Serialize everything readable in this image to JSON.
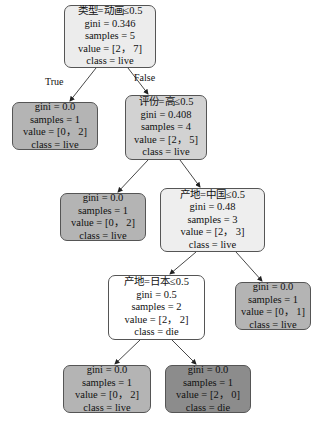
{
  "tree": {
    "nodes": [
      {
        "id": "root",
        "split": "类型=动画≤0.5",
        "gini": "gini = 0.346",
        "samples": "samples = 5",
        "value": "value = [2， 7]",
        "class": "class = live",
        "fill": "#ececec"
      },
      {
        "id": "n1",
        "gini": "gini = 0.0",
        "samples": "samples = 1",
        "value": "value = [0， 2]",
        "class": "class = live",
        "fill": "#b4b4b4"
      },
      {
        "id": "n2",
        "split": "评份=高≤0.5",
        "gini": "gini = 0.408",
        "samples": "samples = 4",
        "value": "value = [2， 5]",
        "class": "class = live",
        "fill": "#d2d2d2"
      },
      {
        "id": "n3",
        "gini": "gini = 0.0",
        "samples": "samples = 1",
        "value": "value = [0， 2]",
        "class": "class = live",
        "fill": "#b4b4b4"
      },
      {
        "id": "n4",
        "split": "产地=中国≤0.5",
        "gini": "gini = 0.48",
        "samples": "samples = 3",
        "value": "value = [2， 3]",
        "class": "class = live",
        "fill": "#eeeeee"
      },
      {
        "id": "n5",
        "split": "产地=日本≤0.5",
        "gini": "gini = 0.5",
        "samples": "samples = 2",
        "value": "value = [2， 2]",
        "class": "class = die",
        "fill": "#ffffff"
      },
      {
        "id": "n6",
        "gini": "gini = 0.0",
        "samples": "samples = 1",
        "value": "value = [0， 1]",
        "class": "class = live",
        "fill": "#b4b4b4"
      },
      {
        "id": "n7",
        "gini": "gini = 0.0",
        "samples": "samples = 1",
        "value": "value = [0， 2]",
        "class": "class = live",
        "fill": "#b4b4b4"
      },
      {
        "id": "n8",
        "gini": "gini = 0.0",
        "samples": "samples = 1",
        "value": "value = [2， 0]",
        "class": "class = die",
        "fill": "#8c8c8c"
      }
    ],
    "edge_labels": {
      "true": "True",
      "false": "False"
    }
  }
}
